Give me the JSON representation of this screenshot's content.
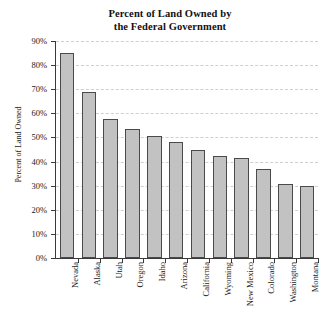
{
  "chart_data": {
    "type": "bar",
    "title": "Percent of Land Owned by the Federal Government",
    "title_lines": [
      "Percent of Land Owned by",
      "the Federal Government"
    ],
    "xlabel": "",
    "ylabel": "Percent of Land Owned",
    "ylim": [
      0,
      90
    ],
    "ytick_step": 10,
    "ytick_labels": [
      "90%",
      "80%",
      "70%",
      "60%",
      "50%",
      "40%",
      "30%",
      "20%",
      "10%",
      "0%"
    ],
    "ytick_values": [
      90,
      80,
      70,
      60,
      50,
      40,
      30,
      20,
      10,
      0
    ],
    "grid": "horizontal-dashed",
    "legend": "none",
    "categories": [
      "Nevada",
      "Alaska",
      "Utah",
      "Oregon",
      "Idaho",
      "Arizona",
      "California",
      "Wyoming",
      "New Mexico",
      "Colorado",
      "Washington",
      "Montana"
    ],
    "values": [
      85,
      69,
      57.5,
      53.5,
      50.5,
      48,
      45,
      42.5,
      41.5,
      37,
      30.5,
      30
    ],
    "bar_fill_color": "#c2c2c2",
    "bar_edge_color": "#4a4a4a",
    "grid_color": "#cfcfcf",
    "axis_color": "#3a3a3a",
    "background_color": "#ffffff"
  }
}
